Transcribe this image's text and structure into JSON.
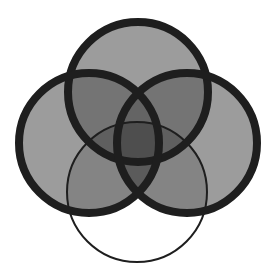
{
  "diagram": {
    "type": "four-set-venn",
    "colors": {
      "background": "#ffffff",
      "fill": "#9c9c9c",
      "stroke": "#1e1e1e"
    },
    "sets": [
      {
        "name": "top-circle",
        "cx": 138,
        "cy": 92,
        "r": 70,
        "stroke_width": 8,
        "filled": true
      },
      {
        "name": "left-circle",
        "cx": 89,
        "cy": 143,
        "r": 70,
        "stroke_width": 8,
        "filled": true
      },
      {
        "name": "right-circle",
        "cx": 187,
        "cy": 143,
        "r": 70,
        "stroke_width": 8,
        "filled": true
      },
      {
        "name": "bottom-circle",
        "cx": 137,
        "cy": 192,
        "r": 70,
        "stroke_width": 2,
        "filled": false
      }
    ]
  }
}
